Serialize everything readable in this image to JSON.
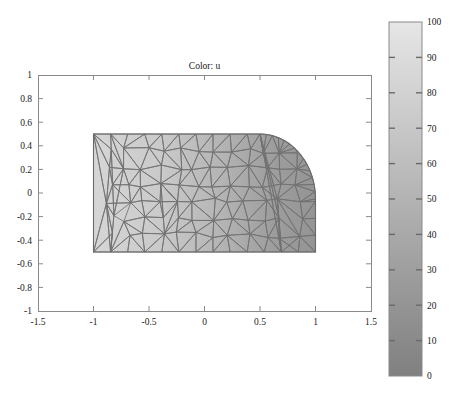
{
  "figure": {
    "background": "#ffffff",
    "title": "Color: u",
    "axis_color": "#808080",
    "text_color": "#1a1a1a"
  },
  "axes": {
    "box": {
      "x": 38,
      "y": 75,
      "w": 333,
      "h": 236
    },
    "xlim": [
      -1.5,
      1.5
    ],
    "ylim": [
      -1,
      1
    ],
    "xticks": [
      -1.5,
      -1,
      -0.5,
      0,
      0.5,
      1,
      1.5
    ],
    "xticklabels": [
      "-1.5",
      "-1",
      "-0.5",
      "0",
      "0.5",
      "1",
      "1.5"
    ],
    "yticks": [
      -1,
      -0.8,
      -0.6,
      -0.4,
      -0.2,
      0,
      0.2,
      0.4,
      0.6,
      0.8,
      1
    ],
    "yticklabels": [
      "-1",
      "-0.8",
      "-0.6",
      "-0.4",
      "-0.2",
      "0",
      "0.2",
      "0.4",
      "0.6",
      "0.8",
      "1"
    ],
    "grid": false
  },
  "colorbar": {
    "box": {
      "x": 389,
      "y": 22,
      "w": 33,
      "h": 354
    },
    "min": 0,
    "max": 100,
    "ticks": [
      0,
      10,
      20,
      30,
      40,
      50,
      60,
      70,
      80,
      90,
      100
    ],
    "ticklabels": [
      "0",
      "10",
      "20",
      "30",
      "40",
      "50",
      "60",
      "70",
      "80",
      "90",
      "100"
    ],
    "colormap_low": "#808080",
    "colormap_high": "#e6e6e6",
    "orientation": "vertical"
  },
  "chart_data": {
    "type": "heatmap",
    "title": "Color: u",
    "xlabel": "",
    "ylabel": "",
    "xlim": [
      -1.5,
      1.5
    ],
    "ylim": [
      -1,
      1
    ],
    "grid": false,
    "legend_position": "right-colorbar",
    "colorbar_label": "u",
    "colorbar_range": [
      0,
      100
    ],
    "colorbar_ticks": [
      0,
      10,
      20,
      30,
      40,
      50,
      60,
      70,
      80,
      90,
      100
    ],
    "domain": {
      "type": "rectangle_with_circular_notch",
      "rect_x": [
        -1.0,
        1.0
      ],
      "rect_y": [
        -0.5,
        0.5
      ],
      "notch_arc_start": [
        0.5,
        0.5
      ],
      "notch_arc_end": [
        1.0,
        -0.05
      ],
      "notch_corner": [
        1.0,
        0.5
      ],
      "notch_radius": 0.52
    },
    "field": {
      "name": "u",
      "min_value": 38,
      "max_value": 90,
      "left_edge_value": 90,
      "right_edge_value": 38,
      "gradient_direction": "decreasing left-to-right",
      "sample_points": [
        {
          "x": -1.0,
          "y": 0.0,
          "u": 90
        },
        {
          "x": -0.5,
          "y": 0.0,
          "u": 78
        },
        {
          "x": 0.0,
          "y": 0.0,
          "u": 64
        },
        {
          "x": 0.5,
          "y": 0.0,
          "u": 50
        },
        {
          "x": 1.0,
          "y": -0.3,
          "u": 38
        },
        {
          "x": -1.0,
          "y": 0.5,
          "u": 90
        },
        {
          "x": -1.0,
          "y": -0.5,
          "u": 90
        },
        {
          "x": 0.5,
          "y": 0.5,
          "u": 48
        },
        {
          "x": 1.0,
          "y": -0.5,
          "u": 38
        }
      ]
    },
    "mesh": {
      "visible": true,
      "edge_color": "#6e6e6e",
      "element_type": "triangle",
      "approx_element_count": 150
    }
  }
}
